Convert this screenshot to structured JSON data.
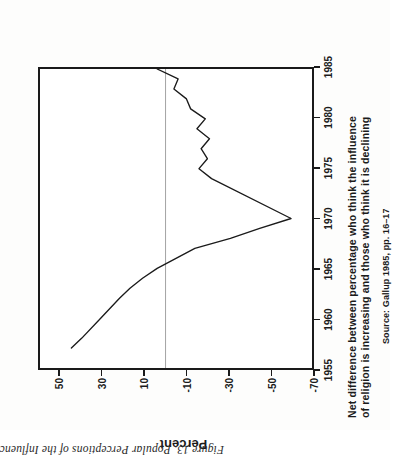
{
  "figure": {
    "caption": "Figure 13.  Popular Perceptions of the Influence of Religion in the United"
  },
  "title": {
    "line1": "Net difference between percentage who think the influence",
    "line2": "of religion is increasing and those who think it is declining",
    "source": "Source: Gallup 1985, pp. 16–17"
  },
  "colors": {
    "ink": "#1a1a1a",
    "line": "#1b1b1b",
    "zero_rule": "#9a9a9a",
    "paper": "#fdfdfc"
  },
  "chart_data": {
    "type": "line",
    "title": "Net difference between percentage who think the influence of religion is increasing and those who think it is declining",
    "subtitle": "Source: Gallup 1985, pp. 16–17",
    "xlabel": "",
    "ylabel": "Percent",
    "xlim": [
      1955,
      1985
    ],
    "ylim": [
      -70,
      60
    ],
    "xticks": [
      1955,
      1960,
      1965,
      1970,
      1975,
      1980,
      1985
    ],
    "yticks": [
      50,
      30,
      10,
      -10,
      -30,
      -50,
      -70
    ],
    "xtick_labels": [
      "1955",
      "1960",
      "1965",
      "1970",
      "1975",
      "1980",
      "1985"
    ],
    "ytick_labels": [
      "50",
      "30",
      "10",
      "-10",
      "-30",
      "-50",
      "-70"
    ],
    "grid": false,
    "legend": false,
    "annotations": [
      {
        "kind": "reference-line",
        "axis": "y",
        "value": 0,
        "style": "thin-grey"
      }
    ],
    "series": [
      {
        "name": "Net difference (increasing minus declining)",
        "x": [
          1957,
          1958,
          1960,
          1962,
          1963,
          1964,
          1965,
          1967,
          1968,
          1969,
          1970,
          1974,
          1975,
          1976,
          1977,
          1978,
          1979,
          1980,
          1981,
          1982,
          1983,
          1984,
          1985
        ],
        "values": [
          45,
          40,
          31,
          22,
          17,
          11,
          4,
          -14,
          -31,
          -45,
          -60,
          -22,
          -16,
          -20,
          -17,
          -21,
          -15,
          -19,
          -12,
          -10,
          -4,
          -6,
          4
        ]
      }
    ]
  }
}
